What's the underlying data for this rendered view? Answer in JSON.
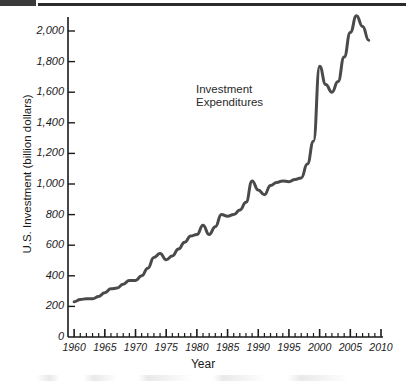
{
  "figure": {
    "ylabel": "U.S. Investment (billion dollars)",
    "xlabel": "Year",
    "annotation": "Investment\nExpenditures",
    "line_color": "#4a4a4a"
  },
  "chart_data": {
    "type": "line",
    "title": "",
    "xlabel": "Year",
    "ylabel": "U.S. Investment (billion dollars)",
    "xlim": [
      1959,
      2010
    ],
    "ylim": [
      0,
      2150
    ],
    "xticks": [
      1960,
      1965,
      1970,
      1975,
      1980,
      1985,
      1990,
      1995,
      2000,
      2005,
      2010
    ],
    "xtick_labels": [
      "1960",
      "1965",
      "1970",
      "1975",
      "1980",
      "1985",
      "1990",
      "1995",
      "2000",
      "2005",
      "2010"
    ],
    "yticks": [
      0,
      200,
      400,
      600,
      800,
      1000,
      1200,
      1400,
      1600,
      1800,
      2000
    ],
    "ytick_labels": [
      "0",
      "200",
      "400",
      "600",
      "800",
      "1,000",
      "1,200",
      "1,400",
      "1,600",
      "1,800",
      "2,000"
    ],
    "minor_xticks_every": 1,
    "grid": false,
    "legend": "none",
    "annotations": [
      {
        "text": "Investment Expenditures",
        "x": 1988,
        "y": 1640
      }
    ],
    "series": [
      {
        "name": "Investment Expenditures",
        "color": "#4a4a4a",
        "x": [
          1960,
          1961,
          1962,
          1963,
          1964,
          1965,
          1966,
          1967,
          1968,
          1969,
          1970,
          1971,
          1972,
          1973,
          1974,
          1975,
          1976,
          1977,
          1978,
          1979,
          1980,
          1981,
          1982,
          1983,
          1984,
          1985,
          1986,
          1987,
          1988,
          1989,
          1990,
          1991,
          1992,
          1993,
          1994,
          1995,
          1996,
          1997,
          1998,
          1999,
          2000,
          2001,
          2002,
          2003,
          2004,
          2005,
          2006,
          2007,
          2008
        ],
        "values": [
          230,
          245,
          250,
          250,
          265,
          290,
          315,
          320,
          345,
          370,
          370,
          400,
          450,
          520,
          545,
          505,
          530,
          575,
          620,
          660,
          670,
          730,
          670,
          720,
          800,
          790,
          800,
          830,
          880,
          1020,
          960,
          930,
          990,
          1010,
          1020,
          1015,
          1030,
          1040,
          1130,
          1280,
          1770,
          1650,
          1600,
          1670,
          1830,
          1990,
          2100,
          2030,
          1940
        ]
      }
    ]
  },
  "axis_geometry": {
    "left_px": 68,
    "right_px": 381,
    "bottom_px": 337,
    "top_px": 31,
    "x_min": 1959,
    "x_max": 2010,
    "y_min": 0,
    "y_max": 2000
  }
}
